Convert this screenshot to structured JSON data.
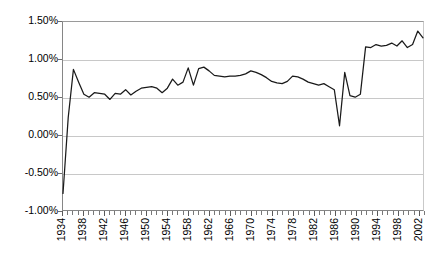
{
  "chart_data": {
    "type": "line",
    "title": "",
    "subtitle": "",
    "xlabel": "",
    "ylabel": "",
    "xlim": [
      1934,
      2003
    ],
    "ylim": [
      -1.0,
      1.5
    ],
    "y_tick_labels": [
      "1.50%",
      "1.00%",
      "0.50%",
      "0.00%",
      "-0.50%",
      "-1.00%"
    ],
    "y_tick_values": [
      1.5,
      1.0,
      0.5,
      0.0,
      -0.5,
      -1.0
    ],
    "y_unit": "%",
    "grid": "horizontal",
    "legend": "none",
    "x_tick_labels": [
      "1934",
      "1938",
      "1942",
      "1946",
      "1950",
      "1954",
      "1958",
      "1962",
      "1966",
      "1970",
      "1974",
      "1978",
      "1982",
      "1986",
      "1990",
      "1994",
      "1998",
      "2002"
    ],
    "x_tick_step": 4,
    "x_minor_tick_step": 1,
    "line_color": "#1a1a1a",
    "gridline_color": "#c8c8c8",
    "axis_color": "#868686",
    "background_color": "#ffffff",
    "x": [
      1934,
      1935,
      1936,
      1937,
      1938,
      1939,
      1940,
      1941,
      1942,
      1943,
      1944,
      1945,
      1946,
      1947,
      1948,
      1949,
      1950,
      1951,
      1952,
      1953,
      1954,
      1955,
      1956,
      1957,
      1958,
      1959,
      1960,
      1961,
      1962,
      1963,
      1964,
      1965,
      1966,
      1967,
      1968,
      1969,
      1970,
      1971,
      1972,
      1973,
      1974,
      1975,
      1976,
      1977,
      1978,
      1979,
      1980,
      1981,
      1982,
      1983,
      1984,
      1985,
      1986,
      1987,
      1988,
      1989,
      1990,
      1991,
      1992,
      1993,
      1994,
      1995,
      1996,
      1997,
      1998,
      1999,
      2000,
      2001,
      2002,
      2003
    ],
    "series": [
      {
        "name": "rate",
        "values": [
          -0.78,
          0.23,
          0.87,
          0.7,
          0.54,
          0.5,
          0.56,
          0.55,
          0.54,
          0.47,
          0.55,
          0.54,
          0.6,
          0.53,
          0.58,
          0.62,
          0.63,
          0.64,
          0.62,
          0.56,
          0.62,
          0.74,
          0.66,
          0.7,
          0.89,
          0.66,
          0.88,
          0.9,
          0.85,
          0.79,
          0.78,
          0.77,
          0.78,
          0.78,
          0.79,
          0.81,
          0.85,
          0.83,
          0.8,
          0.76,
          0.71,
          0.69,
          0.68,
          0.71,
          0.78,
          0.77,
          0.74,
          0.7,
          0.68,
          0.66,
          0.68,
          0.64,
          0.6,
          0.12,
          0.83,
          0.52,
          0.5,
          0.54,
          1.17,
          1.16,
          1.2,
          1.18,
          1.19,
          1.22,
          1.18,
          1.25,
          1.16,
          1.2,
          1.38,
          1.29
        ]
      }
    ]
  }
}
